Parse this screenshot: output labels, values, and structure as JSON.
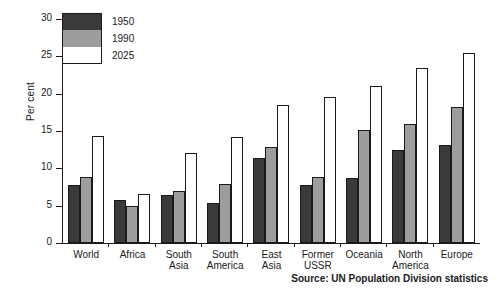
{
  "chart_data": {
    "type": "bar",
    "title": "",
    "xlabel": "",
    "ylabel": "Per cent",
    "ylim": [
      0,
      30
    ],
    "yticks": [
      0,
      5,
      10,
      15,
      20,
      25,
      30
    ],
    "grid": false,
    "legend_position": "top-left",
    "categories": [
      "World",
      "Africa",
      "South\nAsia",
      "South\nAmerica",
      "East\nAsia",
      "Former\nUSSR",
      "Oceania",
      "North\nAmerica",
      "Europe"
    ],
    "series": [
      {
        "name": "1950",
        "color": "#3a3a3a",
        "values": [
          7.8,
          5.8,
          6.4,
          5.4,
          11.4,
          7.8,
          8.7,
          12.4,
          13.1
        ]
      },
      {
        "name": "1990",
        "color": "#9d9d9d",
        "values": [
          8.9,
          5.0,
          6.9,
          7.9,
          12.9,
          8.8,
          15.2,
          15.9,
          18.2
        ]
      },
      {
        "name": "2025",
        "color": "#ffffff",
        "values": [
          14.3,
          6.6,
          12.1,
          14.2,
          18.5,
          19.6,
          21.0,
          23.4,
          25.4
        ]
      }
    ],
    "source_note": "Source: UN Population Division statistics"
  }
}
